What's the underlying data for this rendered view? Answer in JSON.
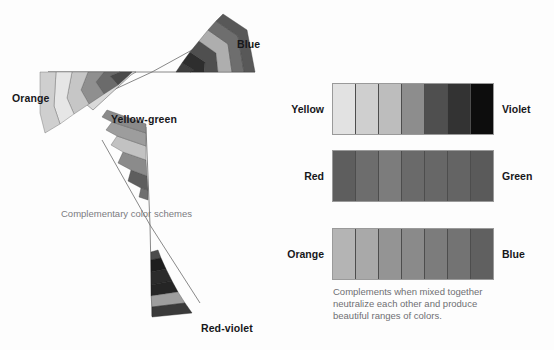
{
  "figure": {
    "caption_left": "Complementary color schemes",
    "caption_right_lines": [
      "Complements when mixed together",
      "neutralize each other and produce",
      "beautiful ranges of colors."
    ]
  },
  "wheel": {
    "labels": {
      "orange": "Orange",
      "blue": "Blue",
      "yellow_green": "Yellow-green",
      "red_violet": "Red-violet"
    },
    "wedges": [
      {
        "name": "orange-wedge",
        "label": "Orange",
        "bands": [
          "#d6d6d6",
          "#e4e4e4",
          "#bdbdbd",
          "#8f8f8f",
          "#636363",
          "#4a4a4a"
        ]
      },
      {
        "name": "blue-wedge",
        "label": "Blue",
        "bands": [
          "#3f3f3f",
          "#2e2e2e",
          "#565656",
          "#a8a8a8",
          "#6e6e6e",
          "#5a5a5a"
        ]
      },
      {
        "name": "yellow-green-wedge",
        "label": "Yellow-green",
        "bands": [
          "#9b9b9b",
          "#8a8a8a",
          "#c0c0c0",
          "#8b8b8b",
          "#6d6d6d",
          "#5e5e5e"
        ]
      },
      {
        "name": "red-violet-wedge",
        "label": "Red-violet",
        "bands": [
          "#4c4c4c",
          "#1c1c1c",
          "#303030",
          "#2a2a2a",
          "#9e9e9e",
          "#3a3a3a"
        ]
      }
    ]
  },
  "mixing_rows": [
    {
      "name": "yellow-violet-row",
      "left_label": "Yellow",
      "right_label": "Violet",
      "swatches": [
        "#e2e2e2",
        "#cfcfcf",
        "#bdbdbd",
        "#8d8d8d",
        "#4f4f4f",
        "#333333",
        "#0d0d0d"
      ]
    },
    {
      "name": "red-green-row",
      "left_label": "Red",
      "right_label": "Green",
      "swatches": [
        "#5e5e5e",
        "#6d6d6d",
        "#7c7c7c",
        "#6a6a6a",
        "#676767",
        "#646464",
        "#5a5a5a"
      ]
    },
    {
      "name": "orange-blue-row",
      "left_label": "Orange",
      "right_label": "Blue",
      "swatches": [
        "#b4b4b4",
        "#a9a9a9",
        "#949494",
        "#8a8a8a",
        "#7c7c7c",
        "#737373",
        "#606060"
      ]
    }
  ]
}
